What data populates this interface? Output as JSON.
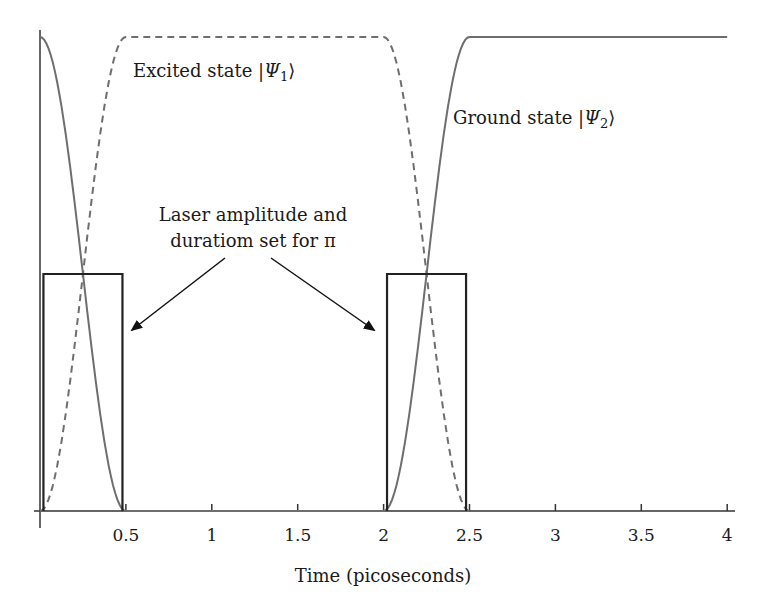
{
  "chart_data": {
    "type": "line",
    "title": "",
    "xlabel": "Time (picoseconds)",
    "ylabel": "",
    "xlim": [
      0,
      4
    ],
    "ylim": [
      0,
      1
    ],
    "grid": false,
    "legend": "none (inline labels)",
    "x_ticks": [
      "0.5",
      "1",
      "1.5",
      "2",
      "2.5",
      "3",
      "3.5",
      "4"
    ],
    "series": [
      {
        "name": "Excited state |Ψ1⟩",
        "style": "dashed",
        "color": "#6e6e6e",
        "x": [
          0,
          0.125,
          0.25,
          0.375,
          0.5,
          2.0,
          2.125,
          2.25,
          2.375,
          2.5
        ],
        "values": [
          0,
          0.15,
          0.5,
          0.85,
          1.0,
          1.0,
          0.85,
          0.5,
          0.15,
          0
        ]
      },
      {
        "name": "Ground state |Ψ2⟩",
        "style": "solid",
        "color": "#6e6e6e",
        "x": [
          0,
          0.125,
          0.25,
          0.375,
          0.5,
          2.0,
          2.125,
          2.25,
          2.375,
          2.5,
          4.0
        ],
        "values": [
          1.0,
          0.85,
          0.5,
          0.15,
          0,
          0,
          0.15,
          0.5,
          0.85,
          1.0,
          1.0
        ]
      },
      {
        "name": "Laser pulse",
        "style": "solid",
        "color": "#222222",
        "pulses": [
          {
            "start": 0.02,
            "end": 0.48,
            "amplitude": 0.5
          },
          {
            "start": 2.02,
            "end": 2.48,
            "amplitude": 0.5
          }
        ]
      }
    ],
    "annotations": [
      {
        "text": "Excited state |Ψ1⟩",
        "label": "Excited state |",
        "psi": "Ψ",
        "sub": "1",
        "close": "⟩"
      },
      {
        "text": "Ground state |Ψ2⟩",
        "label": "Ground state |",
        "psi": "Ψ",
        "sub": "2",
        "close": "⟩"
      },
      {
        "text": "Laser amplitude and duratiom set for π",
        "line1": "Laser amplitude and",
        "line2": "duratiom set for π"
      }
    ]
  }
}
